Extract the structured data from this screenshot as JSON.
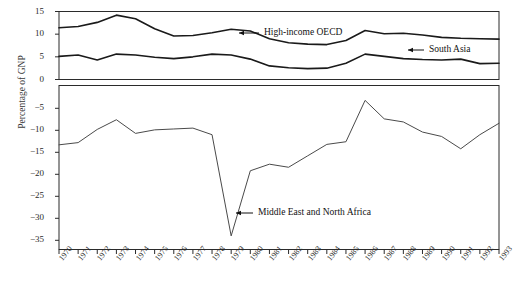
{
  "chart_data": {
    "type": "line",
    "title": "",
    "xlabel": "",
    "ylabel": "Percentage of GNP",
    "grid": false,
    "legend_position": "inline-annotations",
    "x": [
      1970,
      1971,
      1972,
      1973,
      1974,
      1975,
      1976,
      1977,
      1978,
      1979,
      1980,
      1981,
      1982,
      1983,
      1984,
      1985,
      1986,
      1987,
      1988,
      1989,
      1990,
      1991,
      1992,
      1993
    ],
    "categories": [
      "1970",
      "1971",
      "1972",
      "1973",
      "1974",
      "1975",
      "1976",
      "1977",
      "1978",
      "1979",
      "1980",
      "1981",
      "1982",
      "1983",
      "1984",
      "1985",
      "1986",
      "1987",
      "1988",
      "1989",
      "1990",
      "1991",
      "1992",
      "1993"
    ],
    "panels": [
      {
        "name": "upper",
        "ylim": [
          0,
          15
        ],
        "yticks": [
          0,
          5,
          10,
          15
        ],
        "ytick_labels": [
          "0",
          "5",
          "10",
          "15"
        ]
      },
      {
        "name": "lower",
        "ylim": [
          -35,
          -2
        ],
        "yticks": [
          -5,
          -10,
          -15,
          -20,
          -25,
          -30,
          -35
        ],
        "ytick_labels": [
          "−5",
          "−10",
          "−15",
          "−20",
          "−25",
          "−30",
          "−35"
        ]
      }
    ],
    "series": [
      {
        "name": "High-income OECD",
        "panel": "upper",
        "color": "#1a1a1a",
        "values": [
          11.4,
          11.7,
          12.6,
          14.2,
          13.4,
          11.2,
          9.6,
          9.7,
          10.3,
          11.1,
          10.7,
          9.0,
          8.1,
          7.8,
          7.7,
          8.6,
          10.8,
          10.1,
          10.2,
          9.8,
          9.3,
          9.1,
          9.0,
          8.9
        ]
      },
      {
        "name": "South Asia",
        "panel": "upper",
        "color": "#1a1a1a",
        "values": [
          5.1,
          5.4,
          4.3,
          5.6,
          5.4,
          4.9,
          4.6,
          5.0,
          5.6,
          5.4,
          4.5,
          3.0,
          2.6,
          2.4,
          2.5,
          3.6,
          5.6,
          5.1,
          4.6,
          4.4,
          4.3,
          4.5,
          3.5,
          3.6
        ]
      },
      {
        "name": "Middle East and North Africa",
        "panel": "lower",
        "color": "#4a4a4a",
        "values": [
          -13.3,
          -12.8,
          -9.8,
          -7.6,
          -10.7,
          -9.9,
          -9.7,
          -9.5,
          -11.0,
          -34.0,
          -19.2,
          -17.7,
          -18.4,
          -15.8,
          -13.2,
          -12.6,
          -3.2,
          -7.4,
          -8.1,
          -10.4,
          -11.4,
          -14.2,
          -11.0,
          -8.4
        ]
      }
    ],
    "annotations": [
      {
        "name": "High-income OECD",
        "label": "High-income OECD"
      },
      {
        "name": "South Asia",
        "label": "South Asia"
      },
      {
        "name": "Middle East and North Africa",
        "label": "Middle East and North Africa"
      }
    ]
  },
  "axis": {
    "ylabel": "Percentage of GNP",
    "ytick_labels": [
      "15",
      "10",
      "5",
      "0",
      "−5",
      "−10",
      "−15",
      "−20",
      "−25",
      "−30",
      "−35"
    ],
    "xtick_labels": [
      "1970",
      "1971",
      "1972",
      "1973",
      "1974",
      "1975",
      "1976",
      "1977",
      "1978",
      "1979",
      "1980",
      "1981",
      "1982",
      "1983",
      "1984",
      "1985",
      "1986",
      "1987",
      "1988",
      "1989",
      "1990",
      "1991",
      "1992",
      "1993"
    ]
  },
  "annotations": {
    "oecd": "High-income OECD",
    "south_asia": "South Asia",
    "mena": "Middle East and North Africa"
  },
  "title": {
    "text": ""
  },
  "colors": {
    "line_dark": "#1a1a1a",
    "line_grey": "#4a4a4a",
    "frame": "#2b2b2b",
    "text": "#1a1a1a"
  }
}
